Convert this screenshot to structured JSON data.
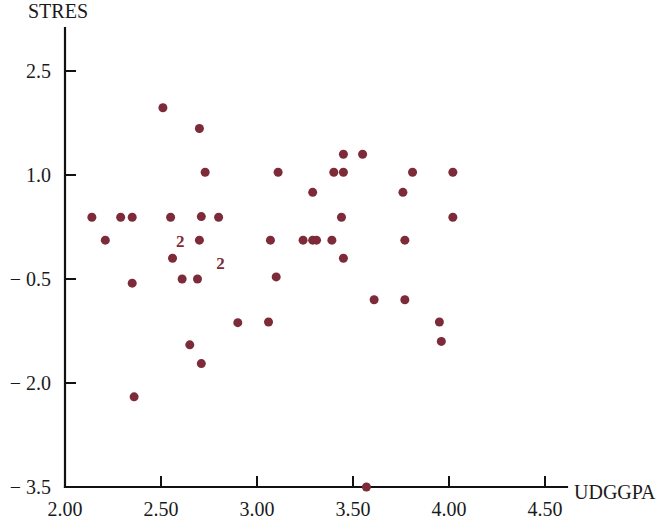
{
  "chart_data": {
    "type": "scatter",
    "title": "",
    "ylabel": "STRES",
    "xlabel": "UDGGPA",
    "xlim": [
      2.0,
      4.75
    ],
    "ylim": [
      -3.5,
      3.0
    ],
    "grid": false,
    "legend": null,
    "marker": {
      "shape": "circle",
      "color": "#7d2b38",
      "size_px": 9
    },
    "xticks": [
      2.0,
      2.5,
      3.0,
      3.5,
      4.0,
      4.5
    ],
    "xtick_labels": [
      "2.00",
      "2.50",
      "3.00",
      "3.50",
      "4.00",
      "4.50"
    ],
    "yticks": [
      2.5,
      1.0,
      -0.5,
      -2.0,
      -3.5
    ],
    "ytick_labels": [
      "2.5",
      "1.0",
      "-0.5",
      "-2.0",
      "-3.5"
    ],
    "points": [
      {
        "x": 2.14,
        "y": 0.39
      },
      {
        "x": 2.29,
        "y": 0.39
      },
      {
        "x": 2.35,
        "y": 0.39
      },
      {
        "x": 2.21,
        "y": 0.06
      },
      {
        "x": 2.35,
        "y": -0.56
      },
      {
        "x": 2.36,
        "y": -2.2
      },
      {
        "x": 2.51,
        "y": 1.97
      },
      {
        "x": 2.55,
        "y": 0.39
      },
      {
        "x": 2.7,
        "y": 1.67
      },
      {
        "x": 2.71,
        "y": 0.4
      },
      {
        "x": 2.8,
        "y": 0.39
      },
      {
        "x": 2.73,
        "y": 1.04
      },
      {
        "x": 2.7,
        "y": 0.06
      },
      {
        "x": 2.56,
        "y": -0.2
      },
      {
        "x": 2.61,
        "y": -0.5
      },
      {
        "x": 2.69,
        "y": -0.5
      },
      {
        "x": 2.65,
        "y": -1.45
      },
      {
        "x": 2.71,
        "y": -1.72
      },
      {
        "x": 2.9,
        "y": -1.13
      },
      {
        "x": 3.06,
        "y": -1.12
      },
      {
        "x": 3.07,
        "y": 0.06
      },
      {
        "x": 3.1,
        "y": -0.47
      },
      {
        "x": 3.11,
        "y": 1.04
      },
      {
        "x": 3.29,
        "y": 0.75
      },
      {
        "x": 3.24,
        "y": 0.06
      },
      {
        "x": 3.29,
        "y": 0.06
      },
      {
        "x": 3.31,
        "y": 0.06
      },
      {
        "x": 3.39,
        "y": 0.06
      },
      {
        "x": 3.4,
        "y": 1.04
      },
      {
        "x": 3.45,
        "y": 1.3
      },
      {
        "x": 3.55,
        "y": 1.3
      },
      {
        "x": 3.44,
        "y": 0.39
      },
      {
        "x": 3.45,
        "y": 1.04
      },
      {
        "x": 3.45,
        "y": -0.2
      },
      {
        "x": 3.61,
        "y": -0.8
      },
      {
        "x": 3.81,
        "y": 1.04
      },
      {
        "x": 3.76,
        "y": 0.75
      },
      {
        "x": 3.77,
        "y": 0.06
      },
      {
        "x": 3.77,
        "y": -0.8
      },
      {
        "x": 3.95,
        "y": -1.12
      },
      {
        "x": 3.96,
        "y": -1.4
      },
      {
        "x": 4.02,
        "y": 1.04
      },
      {
        "x": 4.02,
        "y": 0.39
      },
      {
        "x": 3.57,
        "y": -3.5
      }
    ],
    "overlap_labels": [
      {
        "x": 2.6,
        "y": 0.05,
        "text": "2"
      },
      {
        "x": 2.81,
        "y": -0.27,
        "text": "2"
      }
    ],
    "notes": {
      "overlap_marker_meaning": "2"
    }
  }
}
